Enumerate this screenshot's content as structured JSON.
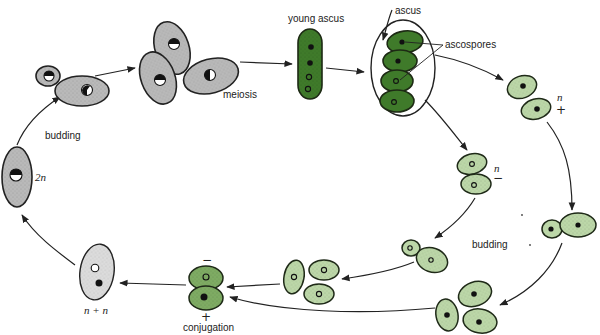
{
  "diagram": {
    "type": "yeast life cycle",
    "colors": {
      "diploid_cell": "#b9b9b9",
      "heterokaryon_cell": "#dcdcdc",
      "ascus_dark_green": "#3f7a2a",
      "haploid_light_green": "#bcd7a8",
      "conjugating_green": "#7eab63"
    },
    "labels": {
      "budding_top": "budding",
      "meiosis": "meiosis",
      "young_ascus": "young ascus",
      "ascus": "ascus",
      "ascospores": "ascospores",
      "ploidy_2n": "2n",
      "ploidy_n_plus": "n",
      "mating_plus": "+",
      "ploidy_n_minus": "n",
      "mating_minus": "−",
      "budding_bottom": "budding",
      "conjugation_minus": "−",
      "conjugation_plus": "+",
      "conjugation": "conjugation",
      "n_plus_n": "n + n"
    },
    "stages": [
      "diploid cell (2n)",
      "budding",
      "meiosis",
      "young ascus",
      "ascus with ascospores",
      "haploid n+ spores",
      "haploid n− spores",
      "budding haploids",
      "conjugation",
      "n + n cell"
    ]
  }
}
